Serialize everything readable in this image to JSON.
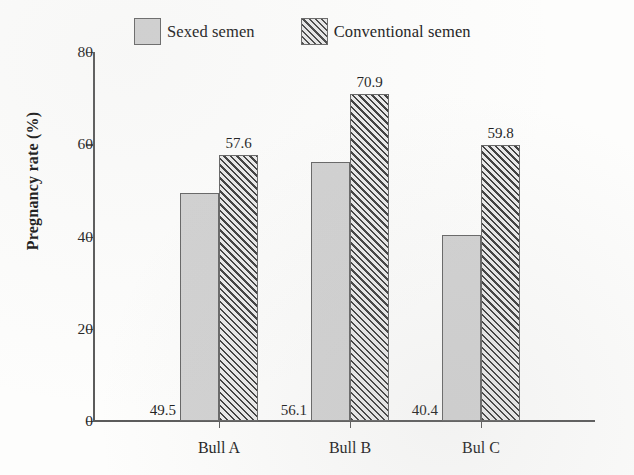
{
  "chart_data": {
    "type": "bar",
    "title": "",
    "xlabel": "",
    "ylabel": "Pregnancy rate (%)",
    "ylim": [
      0,
      80
    ],
    "yticks": [
      0,
      20,
      40,
      60,
      80
    ],
    "ytick_labels": [
      "0",
      "20",
      "40",
      "60",
      "80"
    ],
    "grid": false,
    "legend_position": "top",
    "categories": [
      "Bull A",
      "Bull B",
      "Bul C"
    ],
    "series": [
      {
        "name": "Sexed semen",
        "fill": "solid-gray",
        "color": "#d2d2d2",
        "values": [
          49.5,
          56.1,
          40.4
        ],
        "value_labels": [
          "49.5",
          "56.1",
          "40.4"
        ]
      },
      {
        "name": "Conventional semen",
        "fill": "diagonal-hatch",
        "color": "#3f3f3f",
        "values": [
          57.6,
          70.9,
          59.8
        ],
        "value_labels": [
          "57.6",
          "70.9",
          "59.8"
        ]
      }
    ]
  },
  "legend": {
    "items": [
      {
        "label": "Sexed semen"
      },
      {
        "label": "Conventional semen"
      }
    ]
  },
  "axes": {
    "y_title": "Pregnancy rate (%)"
  }
}
